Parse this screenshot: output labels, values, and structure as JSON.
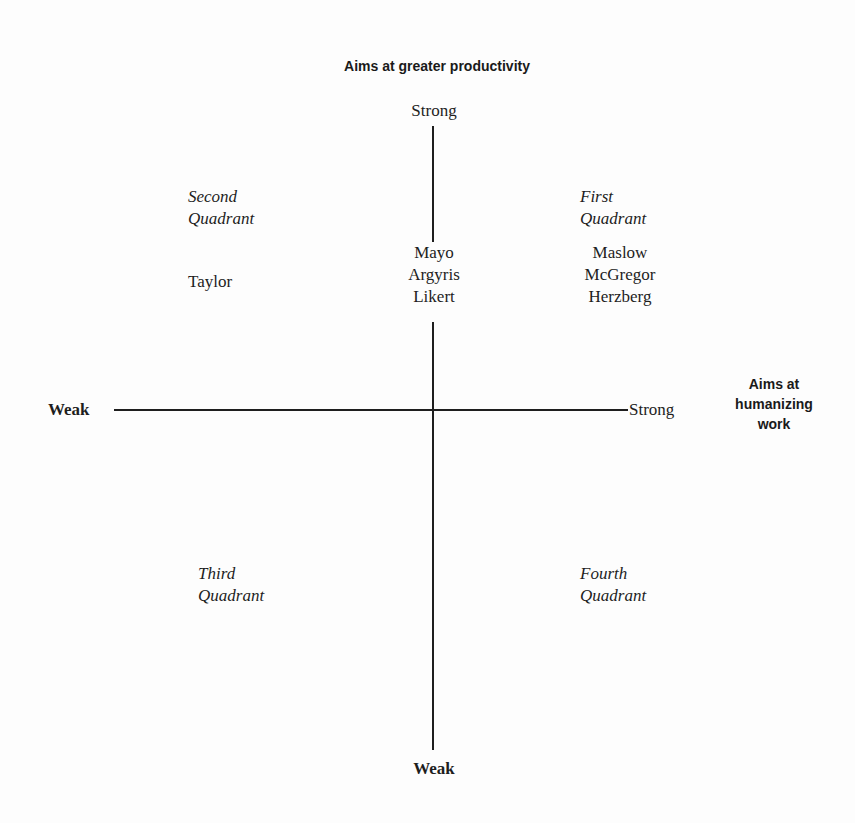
{
  "diagram": {
    "type": "quadrant",
    "vertical_axis": {
      "title": "Aims at greater productivity",
      "top_label": "Strong",
      "bottom_label": "Weak"
    },
    "horizontal_axis": {
      "title_lines": [
        "Aims at",
        "humanizing",
        "work"
      ],
      "left_label": "Weak",
      "right_label": "Strong"
    },
    "quadrants": {
      "first": {
        "name_lines": [
          "First",
          "Quadrant"
        ],
        "members": [
          "Maslow",
          "McGregor",
          "Herzberg"
        ]
      },
      "second": {
        "name_lines": [
          "Second",
          "Quadrant"
        ],
        "members": [
          "Taylor"
        ]
      },
      "third": {
        "name_lines": [
          "Third",
          "Quadrant"
        ],
        "members": []
      },
      "fourth": {
        "name_lines": [
          "Fourth",
          "Quadrant"
        ],
        "members": []
      }
    },
    "center_members": [
      "Mayo",
      "Argyris",
      "Likert"
    ],
    "colors": {
      "ink": "#1e1e1e",
      "background": "#fdfdfd"
    }
  }
}
